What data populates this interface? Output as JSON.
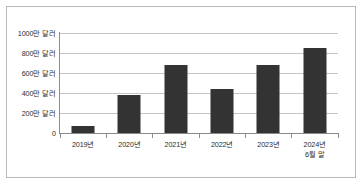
{
  "chart_data": {
    "type": "bar",
    "title": "",
    "subtitle": "",
    "xlabel": "",
    "ylabel": "",
    "categories": [
      "2019년",
      "2020년",
      "2021년",
      "2022년",
      "2023년",
      "2024년 6월 말"
    ],
    "category_lines": [
      [
        "2019년"
      ],
      [
        "2020년"
      ],
      [
        "2021년"
      ],
      [
        "2022년"
      ],
      [
        "2023년"
      ],
      [
        "2024년",
        "6월 말"
      ]
    ],
    "values": [
      70,
      380,
      680,
      440,
      680,
      850
    ],
    "value_unit": "만 달러",
    "ylim": [
      0,
      1000
    ],
    "ytick_values": [
      0,
      200,
      400,
      600,
      800,
      1000
    ],
    "ytick_labels": [
      "0",
      "200만 달러",
      "400만 달러",
      "600만 달러",
      "800만 달러",
      "1000만 달러"
    ],
    "grid": true,
    "legend": "none",
    "bar_color": "#333333",
    "grid_color": "#c6c6c6",
    "axis_color": "#8a8a8a",
    "background_color": "#ffffff",
    "border_color": "#b9b9b9"
  }
}
